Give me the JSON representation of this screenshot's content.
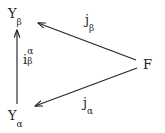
{
  "diagram": {
    "type": "commutative-diagram",
    "background_color": "#ffffff",
    "stroke_color": "#242424",
    "nodes": [
      {
        "id": "Y-beta",
        "base": "Y",
        "subscript": "β",
        "superscript": "",
        "position": "top-left"
      },
      {
        "id": "Y-alpha",
        "base": "Y",
        "subscript": "α",
        "superscript": "",
        "position": "bottom-left"
      },
      {
        "id": "F",
        "base": "F",
        "subscript": "",
        "superscript": "",
        "position": "right"
      }
    ],
    "edges": [
      {
        "id": "j-beta",
        "base": "j",
        "subscript": "β",
        "superscript": "",
        "from": "F",
        "to": "Y-beta",
        "direction": "up-left"
      },
      {
        "id": "j-alpha",
        "base": "j",
        "subscript": "α",
        "superscript": "",
        "from": "F",
        "to": "Y-alpha",
        "direction": "down-left"
      },
      {
        "id": "i-alpha-beta",
        "base": "i",
        "subscript": "β",
        "superscript": "α",
        "from": "Y-alpha",
        "to": "Y-beta",
        "direction": "up"
      }
    ]
  }
}
